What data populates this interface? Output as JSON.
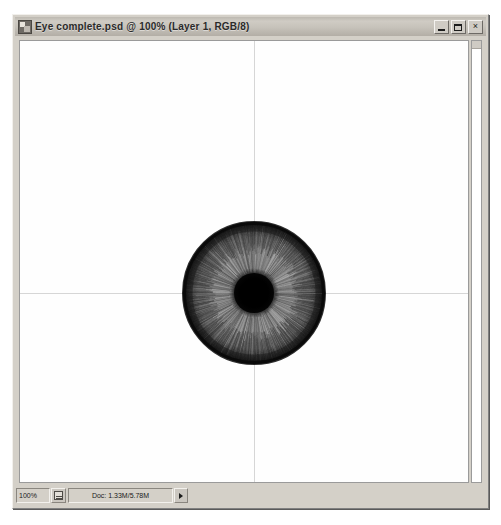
{
  "window": {
    "title": "Eye complete.psd @ 100% (Layer 1, RGB/8)",
    "icon": "photoshop-document-icon",
    "controls": {
      "minimize_label": "",
      "maximize_label": "",
      "close_label": "×"
    }
  },
  "statusbar": {
    "zoom_level": "100%",
    "doc_icon": "document-icon",
    "doc_info": "Doc: 1.33M/5.78M",
    "menu_arrow": "▸"
  },
  "canvas": {
    "background_color": "#fefefe",
    "guide_color": "#d6d6d6",
    "guides": {
      "vertical_x": 234,
      "horizontal_y": 252
    },
    "artwork": {
      "name": "eye-iris",
      "center_x": 234,
      "center_y": 252,
      "iris_radius": 71,
      "pupil_radius": 21,
      "iris_color": "#7d7d7d",
      "limbal_ring_color": "#111111",
      "pupil_color": "#000000"
    }
  },
  "scrollbar": {
    "orientation": "vertical",
    "thumb_position": "top"
  }
}
